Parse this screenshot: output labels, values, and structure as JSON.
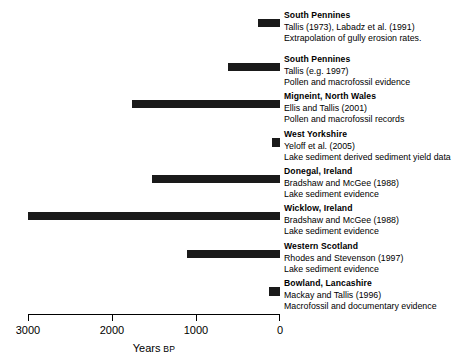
{
  "chart_data": {
    "type": "bar",
    "orientation": "horizontal",
    "title": "",
    "xlabel": "Years BP",
    "xlabel_main": "Years",
    "xlabel_suffix": "BP",
    "ylabel": "",
    "xlim": [
      3000,
      0
    ],
    "x_axis_reversed": true,
    "grid": false,
    "legend": "none",
    "tick_values": [
      3000,
      2000,
      1000,
      0
    ],
    "tick_labels": [
      "3000",
      "2000",
      "1000",
      "0"
    ],
    "bar_color": "#1a1a1a",
    "units": "Years BP (before present)",
    "note": "Each horizontal bar spans the time interval of recorded erosion; all intervals end at 0 BP.",
    "categories": [
      "South Pennines",
      "South Pennines",
      "Migneint, North Wales",
      "West Yorkshire",
      "Donegal, Ireland",
      "Wicklow, Ireland",
      "Western Scotland",
      "Bowland, Lancashire"
    ],
    "entries": [
      {
        "region": "South Pennines",
        "citation": "Tallis (1973), Labadz et al. (1991)",
        "method": "Extrapolation of gully erosion rates.",
        "start_bp": 260,
        "end_bp": 0,
        "duration_years": 260
      },
      {
        "region": "South Pennines",
        "citation": "Tallis (e.g. 1997)",
        "method": "Pollen and macrofossil evidence",
        "start_bp": 620,
        "end_bp": 0,
        "duration_years": 620
      },
      {
        "region": "Migneint, North Wales",
        "citation": "Ellis and Tallis (2001)",
        "method": "Pollen and macrofossil records",
        "start_bp": 1760,
        "end_bp": 0,
        "duration_years": 1760
      },
      {
        "region": "West Yorkshire",
        "citation": "Yeloff et al. (2005)",
        "method": "Lake sediment derived sediment yield data",
        "start_bp": 90,
        "end_bp": 0,
        "duration_years": 90
      },
      {
        "region": "Donegal, Ireland",
        "citation": "Bradshaw and McGee (1988)",
        "method": "Lake sediment evidence",
        "start_bp": 1520,
        "end_bp": 0,
        "duration_years": 1520
      },
      {
        "region": "Wicklow, Ireland",
        "citation": "Bradshaw and McGee (1988)",
        "method": "Lake sediment evidence",
        "start_bp": 3000,
        "end_bp": 0,
        "duration_years": 3000
      },
      {
        "region": "Western Scotland",
        "citation": "Rhodes and Stevenson (1997)",
        "method": "Lake sediment evidence",
        "start_bp": 1110,
        "end_bp": 0,
        "duration_years": 1110
      },
      {
        "region": "Bowland, Lancashire",
        "citation": "Mackay and Tallis (1996)",
        "method": "Macrofossil and documentary evidence",
        "start_bp": 130,
        "end_bp": 0,
        "duration_years": 130
      }
    ]
  }
}
